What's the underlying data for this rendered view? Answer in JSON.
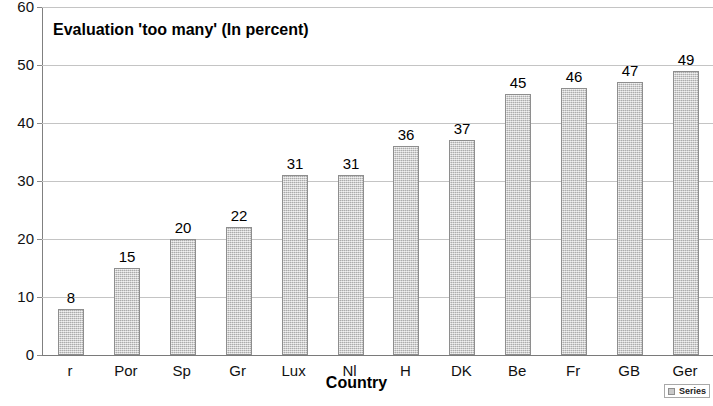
{
  "chart_data": {
    "type": "bar",
    "title": "Evaluation 'too many' (In percent)",
    "xlabel": "Country",
    "ylabel": "",
    "categories": [
      "r",
      "Por",
      "Sp",
      "Gr",
      "Lux",
      "Nl",
      "H",
      "DK",
      "Be",
      "Fr",
      "GB",
      "Ger"
    ],
    "values": [
      8,
      15,
      20,
      22,
      31,
      31,
      36,
      37,
      45,
      46,
      47,
      49
    ],
    "series": [
      {
        "name": "Series",
        "values": [
          8,
          15,
          20,
          22,
          31,
          31,
          36,
          37,
          45,
          46,
          47,
          49
        ]
      }
    ],
    "ylim": [
      0,
      60
    ],
    "yticks": [
      0,
      10,
      20,
      30,
      40,
      50,
      60
    ],
    "ytick_labels": [
      "0",
      "10",
      "20",
      "30",
      "40",
      "50",
      "60"
    ],
    "grid": true,
    "legend": {
      "position": "bottom-right",
      "entries": [
        "Series"
      ]
    },
    "data_labels": [
      "8",
      "15",
      "20",
      "22",
      "31",
      "31",
      "36",
      "37",
      "45",
      "46",
      "47",
      "49"
    ],
    "colors": {
      "bar_fill": "#c9c9c9",
      "bar_border": "#8e8e8e",
      "gridline": "#c4c4c4",
      "axis": "#808080",
      "background": "#ffffff",
      "text": "#000000"
    }
  }
}
